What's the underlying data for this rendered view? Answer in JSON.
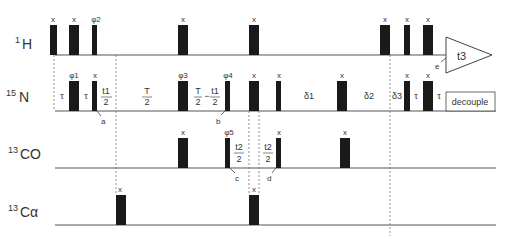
{
  "channels": [
    {
      "id": "h1",
      "sup": "1",
      "label": "H",
      "baseline_y": 55
    },
    {
      "id": "n15",
      "sup": "15",
      "label": "N",
      "baseline_y": 111
    },
    {
      "id": "co13",
      "sup": "13",
      "label": "CO",
      "baseline_y": 168
    },
    {
      "id": "ca13",
      "sup": "13",
      "label": "Cα",
      "baseline_y": 225
    }
  ],
  "pulses": {
    "h1": [
      {
        "x": 50,
        "w": 7,
        "phase": "x"
      },
      {
        "x": 69,
        "w": 10,
        "phase": "x"
      },
      {
        "x": 92,
        "w": 5,
        "phase": "φ2"
      },
      {
        "x": 178,
        "w": 10,
        "phase": "x"
      },
      {
        "x": 249,
        "w": 10,
        "phase": "x"
      },
      {
        "x": 380,
        "w": 10,
        "phase": "x"
      },
      {
        "x": 404,
        "w": 6,
        "phase": "x"
      },
      {
        "x": 423,
        "w": 10,
        "phase": "x"
      }
    ],
    "n15": [
      {
        "x": 69,
        "w": 10,
        "phase": "φ1"
      },
      {
        "x": 92,
        "w": 5,
        "phase": "x"
      },
      {
        "x": 178,
        "w": 10,
        "phase": "φ3"
      },
      {
        "x": 225,
        "w": 5,
        "phase": "φ4"
      },
      {
        "x": 249,
        "w": 10,
        "phase": "x"
      },
      {
        "x": 276,
        "w": 5,
        "phase": "x"
      },
      {
        "x": 337,
        "w": 10,
        "phase": "x"
      },
      {
        "x": 404,
        "w": 6,
        "phase": "x"
      },
      {
        "x": 423,
        "w": 10,
        "phase": "x"
      }
    ],
    "co13": [
      {
        "x": 178,
        "w": 10,
        "phase": "x"
      },
      {
        "x": 225,
        "w": 5,
        "phase": "φ5"
      },
      {
        "x": 276,
        "w": 5,
        "phase": "x"
      },
      {
        "x": 340,
        "w": 10,
        "phase": "x"
      }
    ],
    "ca13": [
      {
        "x": 116,
        "w": 10,
        "phase": "x"
      },
      {
        "x": 249,
        "w": 10,
        "phase": "x"
      }
    ]
  },
  "delays": {
    "tau1": "τ",
    "tau2": "τ",
    "t1_half_num": "t1",
    "t1_half_den": "2",
    "T_half_num": "T",
    "T_half_den": "2",
    "T_minus_num1": "T",
    "T_minus_den1": "2",
    "T_minus_op": "−",
    "T_minus_num2": "t1",
    "T_minus_den2": "2",
    "delta1": "δ1",
    "delta2": "δ2",
    "delta3": "δ3",
    "tau3": "τ",
    "tau4": "τ",
    "t2a_num": "t2",
    "t2a_den": "2",
    "t2b_num": "t2",
    "t2b_den": "2"
  },
  "markers": {
    "a": "a",
    "b": "b",
    "c": "c",
    "d": "d",
    "e": "e"
  },
  "acquisition": {
    "label": "t3"
  },
  "decouple": {
    "label": "decouple"
  },
  "colors": {
    "pulse": "#1a1a1a",
    "line": "#555555",
    "dashed": "#777777",
    "text": "#333333"
  }
}
